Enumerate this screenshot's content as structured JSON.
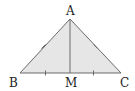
{
  "diagram": {
    "type": "isosceles-triangle-with-median",
    "colors": {
      "fill": "#e6e6e6",
      "stroke": "#6a6a6a",
      "label": "#222222"
    },
    "points": {
      "A": {
        "label": "A",
        "x": 70,
        "y": 19
      },
      "B": {
        "label": "B",
        "x": 20,
        "y": 73
      },
      "C": {
        "label": "C",
        "x": 121,
        "y": 73
      },
      "M": {
        "label": "M",
        "x": 70,
        "y": 73
      }
    },
    "segments": [
      "AB",
      "AC",
      "BC",
      "AM"
    ],
    "equal_marks": [
      {
        "group": 1,
        "segments": [
          "AB",
          "AC"
        ],
        "ticks": 1
      },
      {
        "group": 2,
        "segments": [
          "BM",
          "MC"
        ],
        "ticks": 1
      }
    ]
  }
}
